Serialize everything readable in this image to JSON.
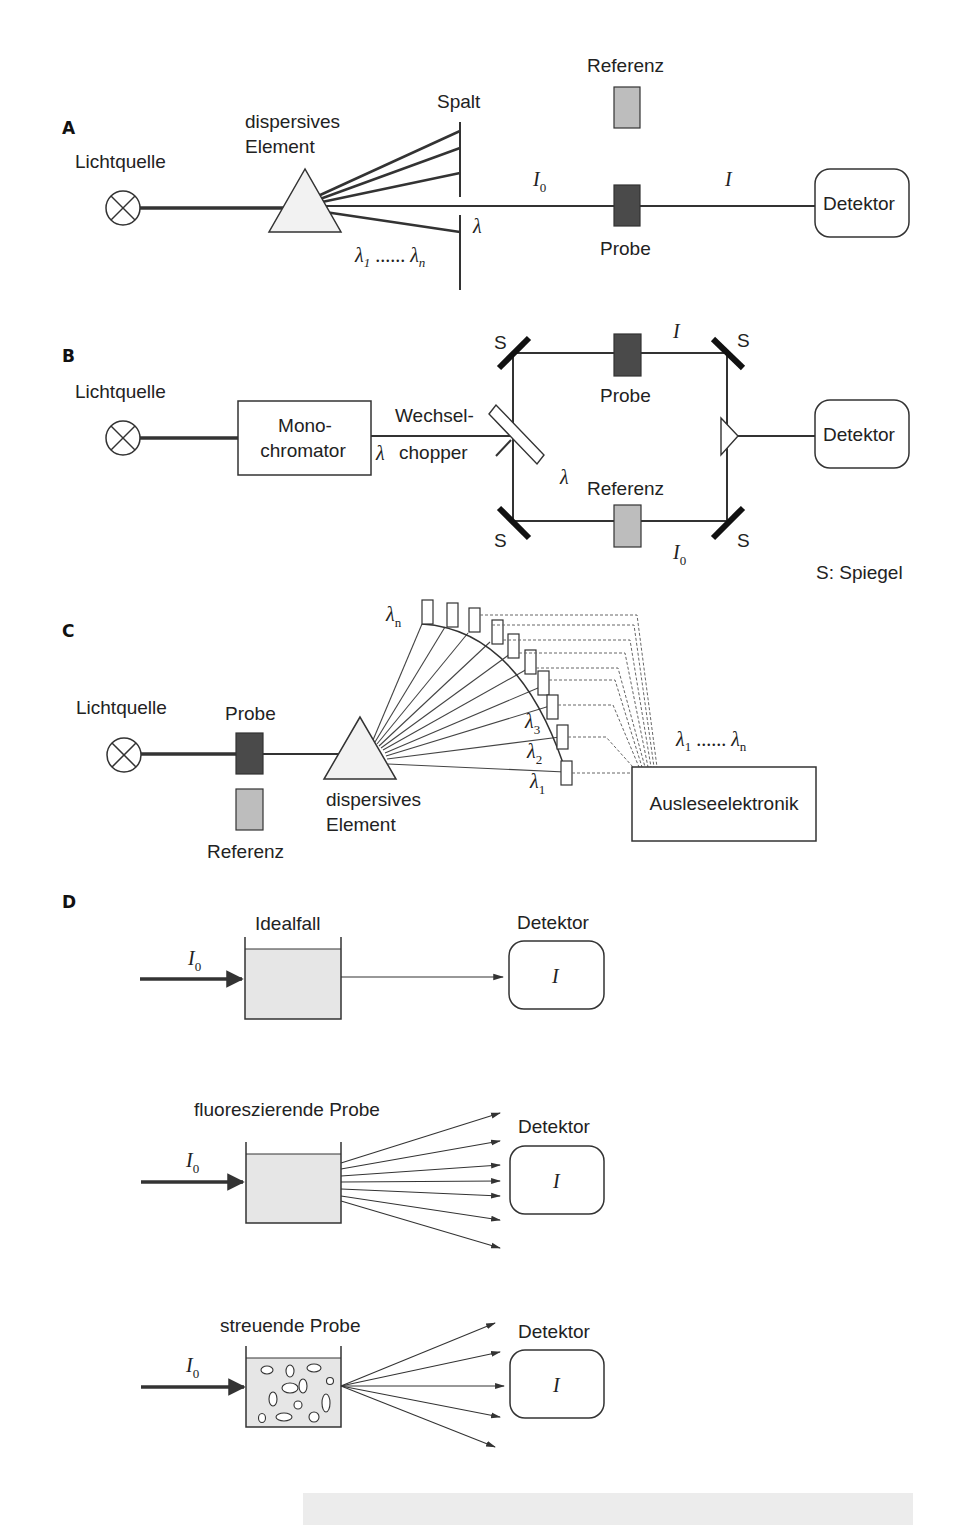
{
  "sections": {
    "A": {
      "label": "A",
      "light_source": "Lichtquelle",
      "dispersive_1": "dispersives",
      "dispersive_2": "Element",
      "slit": "Spalt",
      "reference": "Referenz",
      "sample": "Probe",
      "detector": "Detektor",
      "i0": "I",
      "i0_sub": "0",
      "i": "I",
      "lambda": "λ",
      "lambda_range": {
        "l1": "λ",
        "s1": "1",
        "dots": " ...... ",
        "ln": "λ",
        "sn": "n"
      }
    },
    "B": {
      "label": "B",
      "light_source": "Lichtquelle",
      "mono_1": "Mono-",
      "mono_2": "chromator",
      "lambda": "λ",
      "chopper_1": "Wechsel-",
      "chopper_2": "chopper",
      "mirror": "S",
      "sample": "Probe",
      "reference": "Referenz",
      "detector": "Detektor",
      "i": "I",
      "i0": "I",
      "i0_sub": "0",
      "lambda_inner": "λ",
      "legend": "S: Spiegel"
    },
    "C": {
      "label": "C",
      "light_source": "Lichtquelle",
      "sample": "Probe",
      "reference": "Referenz",
      "dispersive_1": "dispersives",
      "dispersive_2": "Element",
      "lambda_n": {
        "l": "λ",
        "s": "n"
      },
      "lambda_3": {
        "l": "λ",
        "s": "3"
      },
      "lambda_2": {
        "l": "λ",
        "s": "2"
      },
      "lambda_1": {
        "l": "λ",
        "s": "1"
      },
      "lambda_range": {
        "l1": "λ",
        "s1": "1",
        "dots": " ...... ",
        "ln": "λ",
        "sn": "n"
      },
      "readout": "Ausleseelektronik"
    },
    "D": {
      "label": "D",
      "cases": [
        {
          "title": "Idealfall",
          "detector": "Detektor",
          "i0": "I",
          "i0_sub": "0",
          "i": "I"
        },
        {
          "title": "fluoreszierende Probe",
          "detector": "Detektor",
          "i0": "I",
          "i0_sub": "0",
          "i": "I"
        },
        {
          "title": "streuende Probe",
          "detector": "Detektor",
          "i0": "I",
          "i0_sub": "0",
          "i": "I"
        }
      ]
    }
  },
  "colors": {
    "sample_dark": "#4a4a4a",
    "reference_gray": "#bdbdbd",
    "cuvette_fill": "#e6e6e6",
    "prism_fill": "#f2f2f2",
    "line": "#333333",
    "footer_band": "#ececec"
  }
}
